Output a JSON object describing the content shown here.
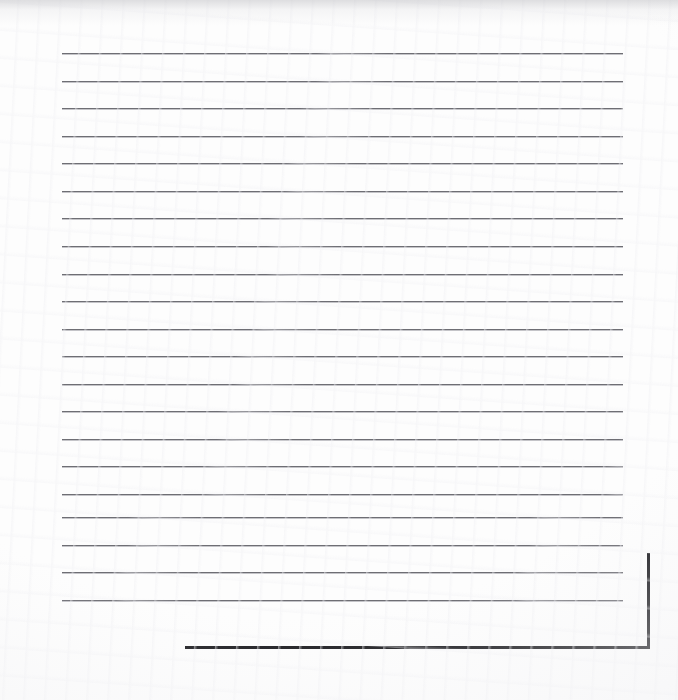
{
  "document": {
    "kind": "scanned-lined-paper",
    "title": "Scanned Lined Paper",
    "page_width": 678,
    "page_height": 700,
    "background_color": "#fdfdfd",
    "text_content": "",
    "has_handwriting": false,
    "has_printed_text": false
  },
  "ruled_lines": {
    "count": 21,
    "color": "#6e6e74",
    "thickness_px": 1,
    "left_x": 62,
    "right_x": 623,
    "first_y": 53,
    "spacing_px": 27.6,
    "positions_y": [
      53,
      81,
      108,
      136,
      163,
      191,
      218,
      246,
      274,
      301,
      329,
      356,
      384,
      411,
      439,
      466,
      494,
      517,
      545,
      572,
      600
    ]
  },
  "page_edge": {
    "color": "#16161a",
    "thickness_px": 3,
    "vertical": {
      "x": 647,
      "y_start": 553,
      "y_end": 648
    },
    "horizontal": {
      "y": 646,
      "x_start": 185,
      "x_end": 650
    }
  },
  "scan_artifacts": {
    "top_shadow_height_px": 26,
    "vignette": true,
    "grain": true
  }
}
